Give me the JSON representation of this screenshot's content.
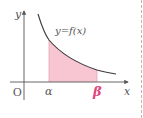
{
  "diagram": {
    "title": "",
    "function_label": "y=f(x)",
    "axes": {
      "x_label": "x",
      "y_label": "y",
      "origin_label": "O"
    },
    "bounds": {
      "lower_label": "α",
      "upper_label": "β"
    },
    "colors": {
      "fill": "#f7c6d2",
      "curve": "#3a3a3a",
      "axis": "#555555",
      "upper_bound_label": "#e0457b",
      "divider": "#bdb9b0"
    }
  }
}
